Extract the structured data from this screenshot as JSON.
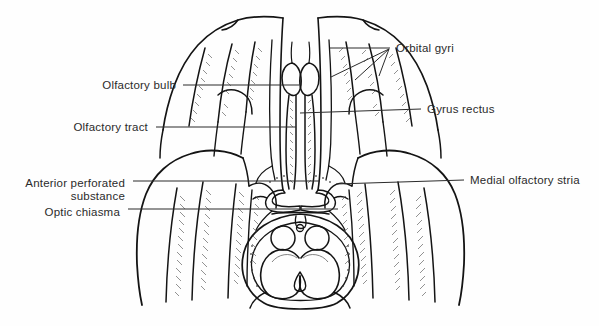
{
  "figure": {
    "type": "anatomical-illustration",
    "view": "inferior view",
    "style": "black-and-white line drawing with stipple/hatch shading",
    "background_color": "#fefefe",
    "ink_color": "#1a1a1a",
    "text_color": "#2b2b2b"
  },
  "labels": [
    {
      "id": "olfactory-bulb",
      "text": "Olfactory bulb",
      "side": "left",
      "text_anchor": "end",
      "text_x": 176,
      "text_y": 85,
      "leader": {
        "x1": 183,
        "y1": 85,
        "x2": 299,
        "y2": 85
      }
    },
    {
      "id": "olfactory-tract",
      "text": "Olfactory tract",
      "side": "left",
      "text_anchor": "end",
      "text_x": 148,
      "text_y": 127,
      "leader": {
        "x1": 156,
        "y1": 127,
        "x2": 296,
        "y2": 127
      }
    },
    {
      "id": "anterior-perforated-substance",
      "text": "Anterior perforated",
      "text_line2": "substance",
      "side": "left",
      "text_anchor": "end",
      "text_x": 125,
      "text_y": 183,
      "text2_x": 125,
      "text2_y": 196,
      "leader": {
        "x1": 133,
        "y1": 181,
        "x2": 320,
        "y2": 181
      }
    },
    {
      "id": "optic-chiasma",
      "text": "Optic chiasma",
      "side": "left",
      "text_anchor": "end",
      "text_x": 120,
      "text_y": 212,
      "leader": {
        "x1": 128,
        "y1": 209,
        "x2": 338,
        "y2": 209
      }
    },
    {
      "id": "orbital-gyri",
      "text": "Orbital gyri",
      "side": "right",
      "text_anchor": "start",
      "text_x": 396,
      "text_y": 51,
      "leader": {
        "x1": 390,
        "y1": 48,
        "x2": 330,
        "y2": 48
      },
      "fan": [
        {
          "x1": 389,
          "y1": 49,
          "x2": 331,
          "y2": 77
        },
        {
          "x1": 389,
          "y1": 49,
          "x2": 355,
          "y2": 80
        },
        {
          "x1": 389,
          "y1": 49,
          "x2": 379,
          "y2": 76
        }
      ]
    },
    {
      "id": "gyrus-rectus",
      "text": "Gyrus rectus",
      "side": "right",
      "text_anchor": "start",
      "text_x": 427,
      "text_y": 112,
      "leader": {
        "x1": 421,
        "y1": 109,
        "x2": 300,
        "y2": 113
      }
    },
    {
      "id": "medial-olfactory-stria",
      "text": "Medial olfactory stria",
      "side": "right",
      "text_anchor": "start",
      "text_x": 470,
      "text_y": 182,
      "leader": {
        "x1": 464,
        "y1": 180,
        "x2": 336,
        "y2": 184
      }
    }
  ],
  "structures": [
    {
      "id": "frontal-lobe-left",
      "name": "left frontal lobe (orbital surface)"
    },
    {
      "id": "frontal-lobe-right",
      "name": "right frontal lobe (orbital surface)"
    },
    {
      "id": "longitudinal-fissure",
      "name": "longitudinal cerebral fissure"
    },
    {
      "id": "olfactory-bulb-left",
      "name": "left olfactory bulb"
    },
    {
      "id": "olfactory-bulb-right",
      "name": "right olfactory bulb"
    },
    {
      "id": "olfactory-tract-left",
      "name": "left olfactory tract"
    },
    {
      "id": "olfactory-tract-right",
      "name": "right olfactory tract"
    },
    {
      "id": "temporal-lobe-left",
      "name": "left temporal lobe"
    },
    {
      "id": "temporal-lobe-right",
      "name": "right temporal lobe"
    },
    {
      "id": "optic-chiasma",
      "name": "optic chiasma"
    },
    {
      "id": "mammillary-bodies",
      "name": "mammillary bodies"
    },
    {
      "id": "midbrain",
      "name": "midbrain / cerebral peduncles"
    },
    {
      "id": "interpeduncular-fossa",
      "name": "interpeduncular fossa"
    }
  ]
}
